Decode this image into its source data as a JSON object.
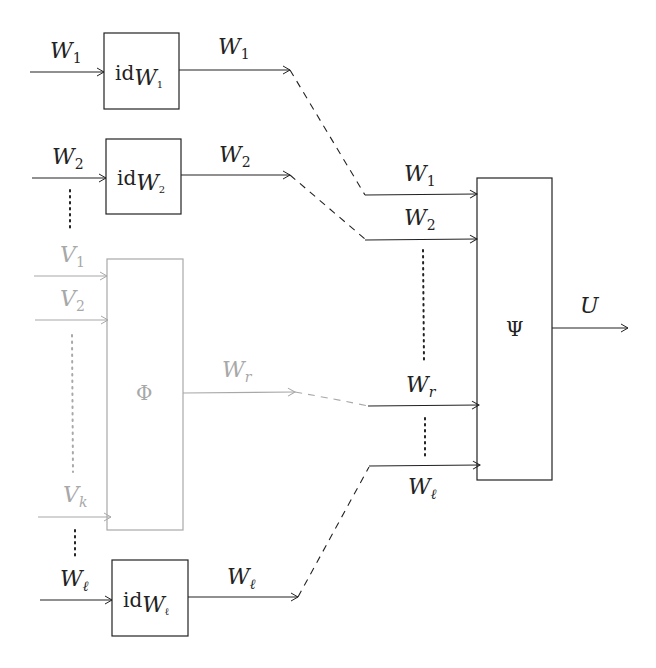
{
  "diagram": {
    "colors": {
      "primary": "#222222",
      "faded": "#a8a8a8",
      "background": "#ffffff"
    },
    "identity_blocks": [
      {
        "id": "id_w1",
        "label_main": "id",
        "label_sub_base": "W",
        "label_sub_index": "1",
        "input_label": "W",
        "input_index": "1",
        "output_label": "W",
        "output_index": "1"
      },
      {
        "id": "id_w2",
        "label_main": "id",
        "label_sub_base": "W",
        "label_sub_index": "2",
        "input_label": "W",
        "input_index": "2",
        "output_label": "W",
        "output_index": "2"
      },
      {
        "id": "id_wl",
        "label_main": "id",
        "label_sub_base": "W",
        "label_sub_index": "ℓ",
        "input_label": "W",
        "input_index": "ℓ",
        "output_label": "W",
        "output_index": "ℓ"
      }
    ],
    "phi_block": {
      "label": "Φ",
      "inputs": [
        {
          "label": "V",
          "index": "1"
        },
        {
          "label": "V",
          "index": "2"
        },
        {
          "label": "V",
          "index": "k"
        }
      ],
      "output": {
        "label": "W",
        "index": "r"
      }
    },
    "psi_block": {
      "label": "Ψ",
      "inputs": [
        {
          "label": "W",
          "index": "1"
        },
        {
          "label": "W",
          "index": "2"
        },
        {
          "label": "W",
          "index": "r"
        },
        {
          "label": "W",
          "index": "ℓ"
        }
      ],
      "output": {
        "label": "U"
      }
    }
  }
}
